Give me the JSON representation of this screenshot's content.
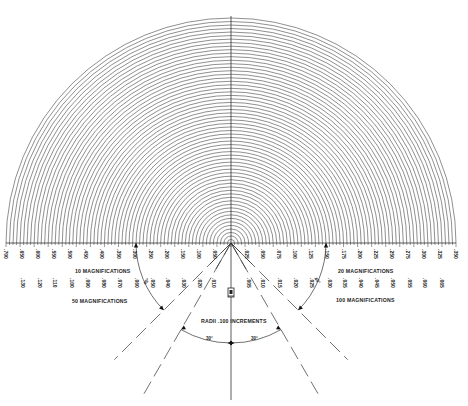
{
  "diagram": {
    "geometry": {
      "center_x": 231,
      "baseline_y": 243,
      "outer_radius": 225,
      "arc_count": 64,
      "vertical_line_bottom_y": 400,
      "colors": {
        "line": "#333333",
        "background": "#ffffff"
      }
    },
    "scales": {
      "left_row1": [
        ".700",
        ".650",
        ".600",
        ".550",
        ".500",
        ".450",
        ".400",
        ".350",
        ".300",
        ".250",
        ".200",
        ".150",
        ".100",
        ".050"
      ],
      "left_row2": [
        ".130",
        ".120",
        ".110",
        ".100",
        ".090",
        ".080",
        ".070",
        ".060",
        ".050",
        ".040",
        ".030",
        ".020",
        ".010"
      ],
      "right_row1": [
        ".025",
        ".050",
        ".075",
        ".100",
        ".125",
        ".150",
        ".175",
        ".200",
        ".225",
        ".250",
        ".275",
        ".300",
        ".325",
        ".350"
      ],
      "right_row2": [
        ".005",
        ".010",
        ".015",
        ".020",
        ".025",
        ".030",
        ".035",
        ".040",
        ".045",
        ".050",
        ".055",
        ".060",
        ".065"
      ]
    },
    "labels": {
      "left_top": "10  MAGNIFICATIONS",
      "left_bottom": "50  MAGNIFICATIONS",
      "right_top": "20  MAGNIFICATIONS",
      "right_bottom": "100  MAGNIFICATIONS",
      "radii": "RADII  .100  INCREMENTS",
      "angle_left_45": "45°",
      "angle_right_45": "45°",
      "angle_left_30": "30°",
      "angle_right_30": "30°"
    },
    "guide_lines": [
      {
        "name": "dashed-line-left-45",
        "angle_deg": -45,
        "length": 165
      },
      {
        "name": "dashed-line-left-30",
        "angle_deg": -30,
        "length": 175
      },
      {
        "name": "dashed-line-right-30",
        "angle_deg": 30,
        "length": 175
      },
      {
        "name": "dashed-line-right-45",
        "angle_deg": 45,
        "length": 165
      }
    ]
  }
}
